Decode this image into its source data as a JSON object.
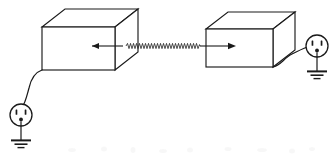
{
  "figure": {
    "background_color": "#ffffff",
    "line_color": "#1a1a1a",
    "width": 333,
    "height": 160,
    "caption": ""
  },
  "devices": [
    {
      "id": "left-enclosure",
      "label": "",
      "shape": "isometric-box",
      "front_face": {
        "x": 42,
        "y": 27,
        "width": 73,
        "height": 43
      },
      "depth_offset": {
        "dx": 23,
        "dy": -18
      },
      "fill": "#ffffff"
    },
    {
      "id": "right-enclosure",
      "label": "",
      "shape": "isometric-box",
      "front_face": {
        "x": 206,
        "y": 29,
        "width": 67,
        "height": 38
      },
      "depth_offset": {
        "dx": 22,
        "dy": -17
      },
      "fill": "#ffffff"
    }
  ],
  "emission_path": {
    "id": "radiated-wave",
    "type": "zigzag",
    "start_x": 126,
    "end_x": 200,
    "baseline_y": 46,
    "amplitude": 2.6,
    "segment_width": 3.0,
    "stroke": "#2a2a2a"
  },
  "arrows": [
    {
      "id": "emitting-arrow",
      "direction": "right",
      "tail": {
        "x": 92,
        "y": 46
      },
      "tip": {
        "x": 126,
        "y": 46
      }
    },
    {
      "id": "receiving-arrow",
      "direction": "right",
      "tail": {
        "x": 200,
        "y": 46
      },
      "tip": {
        "x": 232,
        "y": 46
      }
    }
  ],
  "power_connections": [
    {
      "id": "left-power-cord",
      "from_device": "left-enclosure",
      "to_outlet": "left-outlet",
      "style": "s-curve"
    },
    {
      "id": "right-power-cord",
      "from_device": "right-enclosure",
      "to_outlet": "right-outlet",
      "style": "s-curve"
    }
  ],
  "outlets": [
    {
      "id": "left-outlet",
      "type": "nema-receptacle",
      "center": {
        "x": 21,
        "y": 115
      },
      "radius": 11,
      "slots": 2,
      "has_ground_pin": true,
      "ground_symbol": {
        "bars": 3,
        "stem_bottom_y": 148
      }
    },
    {
      "id": "right-outlet",
      "type": "nema-receptacle",
      "center": {
        "x": 317,
        "y": 46
      },
      "radius": 11,
      "slots": 2,
      "has_ground_pin": true,
      "ground_symbol": {
        "bars": 3,
        "stem_bottom_y": 79
      }
    }
  ]
}
